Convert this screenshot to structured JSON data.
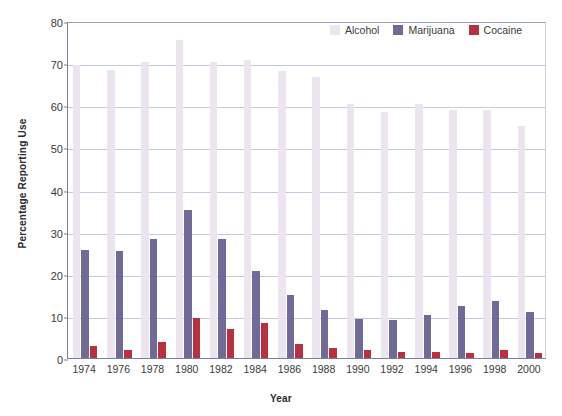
{
  "chart_data": {
    "type": "bar",
    "title": "",
    "xlabel": "Year",
    "ylabel": "Percentage Reporting Use",
    "categories": [
      "1974",
      "1976",
      "1978",
      "1980",
      "1982",
      "1984",
      "1986",
      "1988",
      "1990",
      "1992",
      "1994",
      "1996",
      "1998",
      "2000"
    ],
    "series": [
      {
        "name": "Alcohol",
        "color": "#ece5f0",
        "values": [
          69.5,
          68.3,
          70.2,
          75.5,
          70.2,
          70.8,
          68.2,
          66.6,
          60.2,
          58.4,
          60.2,
          58.9,
          58.9,
          55.0
        ]
      },
      {
        "name": "Marijuana",
        "color": "#6f6a96",
        "values": [
          25.7,
          25.4,
          28.3,
          35.1,
          28.3,
          20.7,
          15.0,
          11.5,
          9.3,
          9.0,
          10.1,
          12.4,
          13.5,
          10.9
        ]
      },
      {
        "name": "Cocaine",
        "color": "#b9303f",
        "values": [
          2.8,
          1.9,
          3.8,
          9.5,
          6.9,
          8.2,
          3.3,
          2.4,
          1.8,
          1.4,
          1.4,
          1.2,
          2.0,
          1.2
        ]
      }
    ],
    "ylim": [
      0,
      80
    ],
    "yticks": [
      0,
      10,
      20,
      30,
      40,
      50,
      60,
      70,
      80
    ],
    "ytick_labels": [
      "0",
      "10",
      "20",
      "30",
      "40",
      "50",
      "60",
      "70",
      "80"
    ],
    "grid": true,
    "legend_position": "top-right",
    "legend_entries": [
      "Alcohol",
      "Marijuana",
      "Cocaine"
    ]
  }
}
